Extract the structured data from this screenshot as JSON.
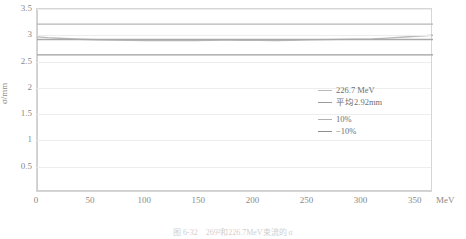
{
  "chart_data": {
    "type": "line",
    "title": "",
    "xlabel": "MeV",
    "ylabel": "σ/mm",
    "xlim": [
      0,
      366
    ],
    "ylim": [
      0,
      3.5
    ],
    "grid": true,
    "legend_position": "inside-right",
    "x_unit_label": "MeV",
    "xticks": [
      0,
      50,
      100,
      150,
      200,
      250,
      300,
      350
    ],
    "xtick_labels": [
      "0",
      "50",
      "100",
      "150",
      "200",
      "250",
      "300",
      "350"
    ],
    "yticks": [
      0.5,
      1,
      1.5,
      2,
      2.5,
      3,
      3.5
    ],
    "ytick_labels": [
      "0.5",
      "1",
      "1.5",
      "2",
      "2.5",
      "3",
      "3.5"
    ],
    "series": [
      {
        "name": "226.7 MeV",
        "color": "#b9b9b9",
        "width": 1.4,
        "x": [
          0,
          10,
          25,
          40,
          55,
          70,
          85,
          100,
          115,
          130,
          145,
          160,
          175,
          190,
          205,
          220,
          235,
          250,
          265,
          280,
          295,
          310,
          320,
          330,
          340,
          350,
          358,
          366
        ],
        "y": [
          2.97,
          2.955,
          2.94,
          2.925,
          2.915,
          2.908,
          2.903,
          2.9,
          2.898,
          2.899,
          2.902,
          2.905,
          2.907,
          2.906,
          2.903,
          2.902,
          2.905,
          2.912,
          2.918,
          2.922,
          2.925,
          2.93,
          2.942,
          2.955,
          2.968,
          2.982,
          2.992,
          3.0
        ]
      },
      {
        "name": "平均2.92mm",
        "color": "#a9a9a9",
        "width": 1.3,
        "constant": 2.92
      },
      {
        "name": "10%",
        "color": "#b5b5b5",
        "width": 1.3,
        "constant": 3.212
      },
      {
        "name": "−10%",
        "color": "#9e9e9e",
        "width": 1.3,
        "constant": 2.628
      }
    ],
    "legend_entries": [
      {
        "label": "226.7 MeV",
        "color": "#b9b9b9"
      },
      {
        "label": "平均2.92mm",
        "color": "#9c9c9c"
      },
      {
        "label": "10%",
        "color": "#b0b0b0"
      },
      {
        "label": "−10%",
        "color": "#8f8f8f"
      }
    ]
  },
  "caption": "图 6-32　269²和226.7MeV束流的 σ"
}
